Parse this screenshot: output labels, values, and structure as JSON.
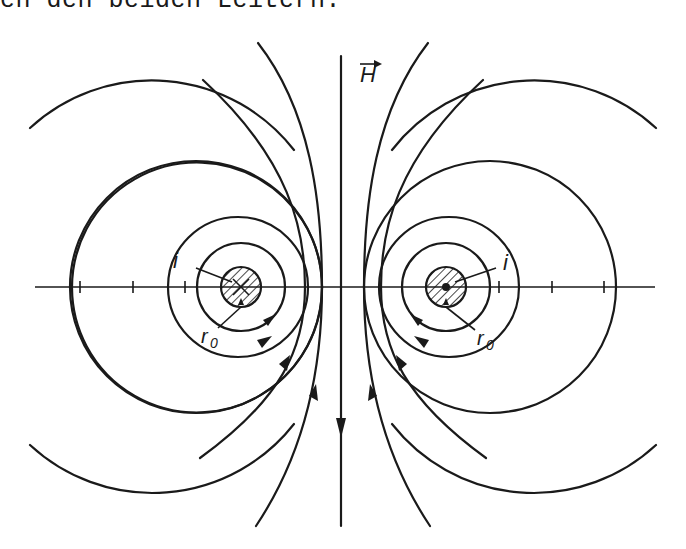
{
  "caption": "en den beiden Leitern.",
  "labels": {
    "field_vector": "H",
    "current_left": "i",
    "current_right": "i",
    "radius_left": "r",
    "radius_right": "r",
    "radius_subscript": "0"
  },
  "figure": {
    "left_conductor": {
      "cx": 241,
      "cy": 287,
      "r": 20,
      "current_symbol": "cross (into page)"
    },
    "right_conductor": {
      "cx": 446,
      "cy": 287,
      "r": 20,
      "current_symbol": "dot (out of page)"
    },
    "axis": {
      "y": 287,
      "x_start": 35,
      "x_end": 655
    },
    "colors": {
      "ink": "#1a1a1a",
      "background": "#ffffff"
    }
  }
}
